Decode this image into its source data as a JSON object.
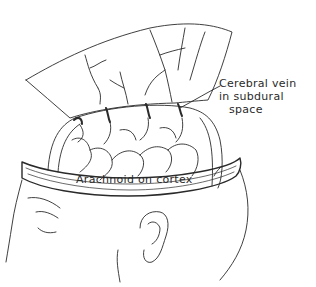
{
  "figure": {
    "labels": {
      "vein_line1": "Cerebral vein",
      "vein_line2": "in subdural",
      "vein_line3": "space",
      "arachnoid": "Arachnoid on cortex"
    },
    "colors": {
      "ink": "#2a2a2a",
      "background": "#ffffff"
    }
  }
}
